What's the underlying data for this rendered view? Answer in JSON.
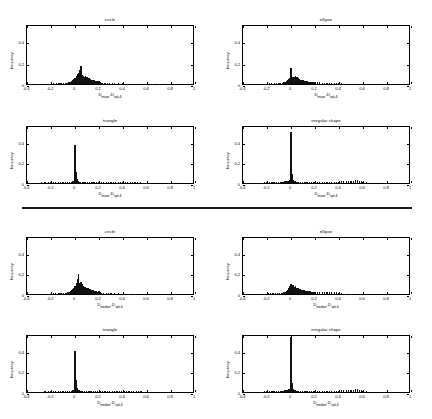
{
  "figure": {
    "divider": {
      "name": "group-separator"
    },
    "axis": {
      "xticks": [
        "-0.4",
        "-0.2",
        "0",
        "0.2",
        "0.4",
        "0.6",
        "0.8",
        "1"
      ],
      "xtick_values": [
        -0.4,
        -0.2,
        0,
        0.2,
        0.4,
        0.6,
        0.8,
        1
      ],
      "yticks": [
        "0",
        "0.2",
        "0.4"
      ],
      "ytick_values": [
        0,
        0.2,
        0.4
      ],
      "xlim": [
        -0.4,
        1
      ],
      "ylim": [
        0,
        0.56
      ]
    },
    "groups": [
      {
        "id": "mean-group",
        "xlabel_main": "D",
        "xlabel_sub1": "mean",
        "xlabel_mid": "-D",
        "xlabel_sub2": "spk-δ",
        "panels": [
          "circle",
          "ellipse",
          "triangle",
          "irregular shape"
        ]
      },
      {
        "id": "median-group",
        "xlabel_main": "D",
        "xlabel_sub1": "median",
        "xlabel_mid": "-D",
        "xlabel_sub2": "spk-δ",
        "panels": [
          "circle",
          "ellipse",
          "triangle",
          "irregular shape"
        ]
      }
    ]
  },
  "chart_data": [
    {
      "type": "bar",
      "id": "top-circle",
      "title": "circle",
      "xlabel": "D_mean - D_spk-δ",
      "ylabel": "frequency",
      "xlim": [
        -0.4,
        1.0
      ],
      "ylim": [
        0,
        0.56
      ],
      "grid": false,
      "legend": "none",
      "bin_width": 0.0115,
      "x": [
        -0.36,
        -0.33,
        -0.3,
        -0.27,
        -0.24,
        -0.21,
        -0.18,
        -0.155,
        -0.14,
        -0.125,
        -0.11,
        -0.095,
        -0.08,
        -0.07,
        -0.06,
        -0.05,
        -0.04,
        -0.03,
        -0.02,
        -0.01,
        0.0,
        0.01,
        0.02,
        0.03,
        0.04,
        0.05,
        0.06,
        0.07,
        0.08,
        0.09,
        0.1,
        0.11,
        0.12,
        0.13,
        0.14,
        0.15,
        0.16,
        0.17,
        0.18,
        0.19,
        0.2,
        0.21,
        0.22,
        0.23,
        0.25,
        0.27,
        0.29,
        0.31,
        0.33,
        0.36,
        0.4,
        0.44,
        0.48,
        0.52,
        0.56,
        0.6,
        0.65,
        0.7,
        0.76,
        0.82,
        0.9
      ],
      "values": [
        0.004,
        0.004,
        0.003,
        0.004,
        0.003,
        0.004,
        0.005,
        0.006,
        0.005,
        0.006,
        0.007,
        0.008,
        0.01,
        0.012,
        0.014,
        0.018,
        0.022,
        0.028,
        0.035,
        0.045,
        0.06,
        0.075,
        0.09,
        0.105,
        0.135,
        0.17,
        0.08,
        0.075,
        0.07,
        0.072,
        0.068,
        0.06,
        0.055,
        0.048,
        0.042,
        0.038,
        0.034,
        0.03,
        0.028,
        0.024,
        0.026,
        0.018,
        0.014,
        0.012,
        0.01,
        0.009,
        0.008,
        0.007,
        0.006,
        0.005,
        0.005,
        0.004,
        0.004,
        0.003,
        0.003,
        0.003,
        0.002,
        0.002,
        0.002,
        0.002,
        0.002
      ]
    },
    {
      "type": "bar",
      "id": "top-ellipse",
      "title": "ellipse",
      "xlabel": "D_mean - D_spk-δ",
      "ylabel": "frequency",
      "xlim": [
        -0.4,
        1.0
      ],
      "ylim": [
        0,
        0.56
      ],
      "grid": false,
      "legend": "none",
      "bin_width": 0.0115,
      "x": [
        -0.36,
        -0.32,
        -0.28,
        -0.24,
        -0.21,
        -0.18,
        -0.16,
        -0.14,
        -0.12,
        -0.1,
        -0.085,
        -0.07,
        -0.06,
        -0.05,
        -0.04,
        -0.03,
        -0.02,
        -0.01,
        0.0,
        0.008,
        0.016,
        0.024,
        0.032,
        0.04,
        0.05,
        0.06,
        0.07,
        0.08,
        0.09,
        0.1,
        0.11,
        0.12,
        0.13,
        0.14,
        0.15,
        0.16,
        0.17,
        0.18,
        0.19,
        0.2,
        0.22,
        0.24,
        0.26,
        0.28,
        0.3,
        0.32,
        0.34,
        0.36,
        0.38,
        0.4,
        0.42,
        0.44,
        0.48,
        0.54,
        0.62,
        0.72,
        0.85
      ],
      "values": [
        0.003,
        0.003,
        0.003,
        0.004,
        0.004,
        0.005,
        0.005,
        0.006,
        0.007,
        0.008,
        0.01,
        0.012,
        0.016,
        0.02,
        0.026,
        0.034,
        0.044,
        0.06,
        0.145,
        0.065,
        0.055,
        0.07,
        0.062,
        0.075,
        0.07,
        0.055,
        0.045,
        0.04,
        0.037,
        0.034,
        0.03,
        0.028,
        0.026,
        0.024,
        0.022,
        0.021,
        0.02,
        0.019,
        0.018,
        0.02,
        0.016,
        0.015,
        0.014,
        0.014,
        0.013,
        0.013,
        0.014,
        0.012,
        0.014,
        0.013,
        0.008,
        0.004,
        0.003,
        0.002,
        0.002,
        0.002,
        0.002
      ]
    },
    {
      "type": "bar",
      "id": "top-triangle",
      "title": "triangle",
      "xlabel": "D_mean - D_spk-δ",
      "ylabel": "frequency",
      "xlim": [
        -0.4,
        1.0
      ],
      "ylim": [
        0,
        0.56
      ],
      "grid": false,
      "legend": "none",
      "bin_width": 0.0115,
      "x": [
        -0.37,
        -0.34,
        -0.31,
        -0.28,
        -0.25,
        -0.22,
        -0.2,
        -0.18,
        -0.16,
        -0.14,
        -0.12,
        -0.1,
        -0.08,
        -0.06,
        -0.045,
        -0.03,
        -0.02,
        -0.012,
        -0.006,
        0.0,
        0.008,
        0.016,
        0.024,
        0.035,
        0.045,
        0.06,
        0.075,
        0.09,
        0.105,
        0.12,
        0.135,
        0.15,
        0.165,
        0.18,
        0.2,
        0.22,
        0.24,
        0.26,
        0.28,
        0.3,
        0.32,
        0.34,
        0.36,
        0.38,
        0.4,
        0.42,
        0.44,
        0.46,
        0.48,
        0.5,
        0.52,
        0.545,
        0.57,
        0.6,
        0.63,
        0.67,
        0.72,
        0.78,
        0.86
      ],
      "values": [
        0.004,
        0.004,
        0.004,
        0.005,
        0.005,
        0.005,
        0.006,
        0.006,
        0.006,
        0.007,
        0.007,
        0.008,
        0.008,
        0.009,
        0.01,
        0.012,
        0.015,
        0.02,
        0.04,
        0.37,
        0.11,
        0.035,
        0.02,
        0.014,
        0.012,
        0.011,
        0.01,
        0.01,
        0.01,
        0.009,
        0.009,
        0.009,
        0.009,
        0.008,
        0.008,
        0.008,
        0.008,
        0.007,
        0.007,
        0.007,
        0.007,
        0.007,
        0.007,
        0.006,
        0.006,
        0.006,
        0.006,
        0.006,
        0.005,
        0.005,
        0.005,
        0.005,
        0.004,
        0.004,
        0.003,
        0.003,
        0.003,
        0.002,
        0.002
      ]
    },
    {
      "type": "bar",
      "id": "top-irregular",
      "title": "irregular shape",
      "xlabel": "D_mean - D_spk-δ",
      "ylabel": "frequency",
      "xlim": [
        -0.4,
        1.0
      ],
      "ylim": [
        0,
        0.56
      ],
      "grid": false,
      "legend": "none",
      "bin_width": 0.0115,
      "x": [
        -0.37,
        -0.34,
        -0.31,
        -0.28,
        -0.25,
        -0.22,
        -0.2,
        -0.18,
        -0.165,
        -0.15,
        -0.135,
        -0.12,
        -0.105,
        -0.09,
        -0.075,
        -0.06,
        -0.05,
        -0.04,
        -0.03,
        -0.02,
        -0.01,
        0.0,
        0.008,
        0.016,
        0.025,
        0.035,
        0.05,
        0.065,
        0.08,
        0.095,
        0.11,
        0.125,
        0.14,
        0.155,
        0.17,
        0.185,
        0.2,
        0.22,
        0.24,
        0.26,
        0.28,
        0.3,
        0.32,
        0.34,
        0.36,
        0.38,
        0.4,
        0.42,
        0.44,
        0.46,
        0.48,
        0.5,
        0.52,
        0.54,
        0.555,
        0.57,
        0.585,
        0.6,
        0.63,
        0.67,
        0.72,
        0.8
      ],
      "values": [
        0.003,
        0.003,
        0.004,
        0.004,
        0.004,
        0.005,
        0.005,
        0.006,
        0.007,
        0.008,
        0.008,
        0.009,
        0.01,
        0.011,
        0.012,
        0.014,
        0.016,
        0.018,
        0.02,
        0.024,
        0.03,
        0.49,
        0.085,
        0.03,
        0.02,
        0.016,
        0.014,
        0.013,
        0.012,
        0.012,
        0.012,
        0.011,
        0.011,
        0.011,
        0.01,
        0.01,
        0.01,
        0.01,
        0.01,
        0.01,
        0.01,
        0.011,
        0.011,
        0.012,
        0.012,
        0.013,
        0.014,
        0.015,
        0.016,
        0.018,
        0.02,
        0.022,
        0.024,
        0.026,
        0.028,
        0.024,
        0.018,
        0.012,
        0.005,
        0.003,
        0.002,
        0.002
      ]
    },
    {
      "type": "bar",
      "id": "bottom-circle",
      "title": "circle",
      "xlabel": "D_median - D_spk-δ",
      "ylabel": "frequency",
      "xlim": [
        -0.4,
        1.0
      ],
      "ylim": [
        0,
        0.56
      ],
      "grid": false,
      "legend": "none",
      "bin_width": 0.0115,
      "x": [
        -0.36,
        -0.33,
        -0.3,
        -0.27,
        -0.24,
        -0.21,
        -0.18,
        -0.16,
        -0.14,
        -0.125,
        -0.11,
        -0.095,
        -0.08,
        -0.07,
        -0.06,
        -0.05,
        -0.04,
        -0.03,
        -0.02,
        -0.01,
        0.0,
        0.01,
        0.02,
        0.03,
        0.04,
        0.05,
        0.06,
        0.07,
        0.08,
        0.09,
        0.1,
        0.11,
        0.12,
        0.13,
        0.14,
        0.15,
        0.16,
        0.17,
        0.18,
        0.19,
        0.2,
        0.21,
        0.22,
        0.24,
        0.26,
        0.28,
        0.3,
        0.33,
        0.36,
        0.4,
        0.45,
        0.5,
        0.56,
        0.64,
        0.74,
        0.86
      ],
      "values": [
        0.003,
        0.003,
        0.003,
        0.003,
        0.004,
        0.004,
        0.005,
        0.005,
        0.006,
        0.006,
        0.007,
        0.008,
        0.01,
        0.012,
        0.016,
        0.02,
        0.026,
        0.034,
        0.044,
        0.058,
        0.082,
        0.11,
        0.145,
        0.19,
        0.105,
        0.12,
        0.095,
        0.08,
        0.07,
        0.066,
        0.06,
        0.055,
        0.05,
        0.045,
        0.04,
        0.036,
        0.032,
        0.028,
        0.026,
        0.024,
        0.03,
        0.018,
        0.014,
        0.01,
        0.008,
        0.007,
        0.006,
        0.005,
        0.005,
        0.004,
        0.003,
        0.003,
        0.002,
        0.002,
        0.002,
        0.002
      ]
    },
    {
      "type": "bar",
      "id": "bottom-ellipse",
      "title": "ellipse",
      "xlabel": "D_median - D_spk-δ",
      "ylabel": "frequency",
      "xlim": [
        -0.4,
        1.0
      ],
      "ylim": [
        0,
        0.56
      ],
      "grid": false,
      "legend": "none",
      "bin_width": 0.0115,
      "x": [
        -0.36,
        -0.32,
        -0.28,
        -0.25,
        -0.22,
        -0.19,
        -0.17,
        -0.15,
        -0.13,
        -0.11,
        -0.095,
        -0.08,
        -0.07,
        -0.06,
        -0.05,
        -0.04,
        -0.03,
        -0.02,
        -0.01,
        0.0,
        0.01,
        0.02,
        0.03,
        0.04,
        0.05,
        0.06,
        0.07,
        0.08,
        0.09,
        0.1,
        0.11,
        0.12,
        0.13,
        0.14,
        0.15,
        0.16,
        0.17,
        0.18,
        0.19,
        0.2,
        0.22,
        0.24,
        0.26,
        0.28,
        0.3,
        0.32,
        0.34,
        0.36,
        0.38,
        0.4,
        0.42,
        0.45,
        0.5,
        0.58,
        0.68,
        0.8
      ],
      "values": [
        0.003,
        0.003,
        0.004,
        0.004,
        0.004,
        0.005,
        0.005,
        0.006,
        0.007,
        0.008,
        0.009,
        0.011,
        0.014,
        0.018,
        0.024,
        0.032,
        0.042,
        0.056,
        0.074,
        0.1,
        0.085,
        0.09,
        0.07,
        0.075,
        0.062,
        0.056,
        0.05,
        0.046,
        0.042,
        0.038,
        0.035,
        0.032,
        0.03,
        0.028,
        0.026,
        0.025,
        0.024,
        0.023,
        0.022,
        0.024,
        0.02,
        0.019,
        0.018,
        0.018,
        0.017,
        0.017,
        0.018,
        0.016,
        0.017,
        0.014,
        0.008,
        0.004,
        0.003,
        0.002,
        0.002,
        0.002
      ]
    },
    {
      "type": "bar",
      "id": "bottom-triangle",
      "title": "triangle",
      "xlabel": "D_median - D_spk-δ",
      "ylabel": "frequency",
      "xlim": [
        -0.4,
        1.0
      ],
      "ylim": [
        0,
        0.56
      ],
      "grid": false,
      "legend": "none",
      "bin_width": 0.0115,
      "x": [
        -0.37,
        -0.34,
        -0.31,
        -0.28,
        -0.25,
        -0.22,
        -0.2,
        -0.18,
        -0.16,
        -0.14,
        -0.12,
        -0.1,
        -0.08,
        -0.06,
        -0.045,
        -0.03,
        -0.02,
        -0.012,
        -0.006,
        0.0,
        0.008,
        0.016,
        0.024,
        0.035,
        0.05,
        0.065,
        0.08,
        0.095,
        0.11,
        0.125,
        0.14,
        0.155,
        0.17,
        0.19,
        0.21,
        0.23,
        0.25,
        0.27,
        0.29,
        0.31,
        0.33,
        0.35,
        0.37,
        0.39,
        0.41,
        0.43,
        0.45,
        0.47,
        0.49,
        0.51,
        0.53,
        0.55,
        0.58,
        0.62,
        0.67,
        0.74,
        0.84
      ],
      "values": [
        0.003,
        0.004,
        0.004,
        0.004,
        0.005,
        0.005,
        0.005,
        0.006,
        0.006,
        0.007,
        0.007,
        0.008,
        0.008,
        0.009,
        0.01,
        0.012,
        0.015,
        0.02,
        0.045,
        0.4,
        0.12,
        0.038,
        0.022,
        0.015,
        0.012,
        0.011,
        0.011,
        0.01,
        0.01,
        0.01,
        0.009,
        0.009,
        0.009,
        0.009,
        0.008,
        0.008,
        0.008,
        0.008,
        0.008,
        0.008,
        0.007,
        0.007,
        0.007,
        0.007,
        0.007,
        0.006,
        0.006,
        0.006,
        0.006,
        0.005,
        0.005,
        0.005,
        0.004,
        0.003,
        0.003,
        0.002,
        0.002
      ]
    },
    {
      "type": "bar",
      "id": "bottom-irregular",
      "title": "irregular shape",
      "xlabel": "D_median - D_spk-δ",
      "ylabel": "frequency",
      "xlim": [
        -0.4,
        1.0
      ],
      "ylim": [
        0,
        0.56
      ],
      "grid": false,
      "legend": "none",
      "bin_width": 0.0115,
      "x": [
        -0.37,
        -0.34,
        -0.31,
        -0.28,
        -0.25,
        -0.22,
        -0.2,
        -0.18,
        -0.165,
        -0.15,
        -0.135,
        -0.12,
        -0.105,
        -0.09,
        -0.075,
        -0.06,
        -0.05,
        -0.04,
        -0.03,
        -0.02,
        -0.01,
        0.0,
        0.008,
        0.016,
        0.025,
        0.035,
        0.05,
        0.065,
        0.08,
        0.095,
        0.11,
        0.125,
        0.14,
        0.155,
        0.17,
        0.185,
        0.2,
        0.22,
        0.24,
        0.26,
        0.28,
        0.3,
        0.32,
        0.34,
        0.36,
        0.38,
        0.4,
        0.42,
        0.44,
        0.46,
        0.48,
        0.5,
        0.52,
        0.54,
        0.555,
        0.57,
        0.585,
        0.6,
        0.63,
        0.67,
        0.73,
        0.82
      ],
      "values": [
        0.003,
        0.003,
        0.003,
        0.004,
        0.004,
        0.005,
        0.005,
        0.006,
        0.007,
        0.008,
        0.008,
        0.009,
        0.01,
        0.011,
        0.012,
        0.014,
        0.016,
        0.018,
        0.021,
        0.025,
        0.032,
        0.53,
        0.09,
        0.032,
        0.021,
        0.016,
        0.014,
        0.013,
        0.012,
        0.012,
        0.012,
        0.011,
        0.011,
        0.011,
        0.01,
        0.01,
        0.01,
        0.01,
        0.01,
        0.01,
        0.01,
        0.011,
        0.011,
        0.012,
        0.012,
        0.013,
        0.014,
        0.015,
        0.016,
        0.018,
        0.02,
        0.022,
        0.024,
        0.026,
        0.028,
        0.024,
        0.018,
        0.012,
        0.005,
        0.003,
        0.002,
        0.002
      ]
    }
  ]
}
